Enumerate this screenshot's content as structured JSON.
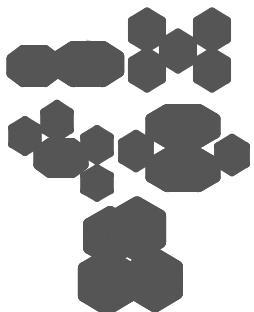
{
  "figure": {
    "panels": [
      {
        "id": "a",
        "label": "single-icosahedron-pair",
        "clusters": 2
      },
      {
        "id": "b",
        "label": "five-icosahedra-x-arrangement",
        "clusters": 5
      },
      {
        "id": "c",
        "label": "chain-of-icosahedra",
        "clusters": 5
      },
      {
        "id": "d",
        "label": "double-layer-with-side-icosahedra",
        "clusters": 4
      },
      {
        "id": "e",
        "label": "tetrahedral-cluster-of-icosahedra",
        "clusters": 4
      }
    ],
    "colors": {
      "light": "#e6e6e6",
      "mid": "#b5b5b5",
      "dark": "#7a7a7a",
      "darkest": "#3e3e3e",
      "edge": "#555555"
    }
  }
}
